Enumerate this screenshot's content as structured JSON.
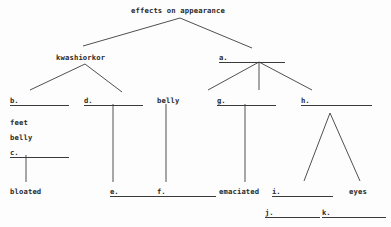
{
  "diagram": {
    "title": "effects on appearance",
    "type": "hierarchy-tree-worksheet",
    "line_color": "#3c3c3c",
    "text_color": "#2b2b2b",
    "background_color": "#fdfdfd"
  },
  "nodes": {
    "root": {
      "text": "effects on appearance",
      "x": 131,
      "y": 6
    },
    "kwashiorkor": {
      "text": "kwashiorkor",
      "x": 56,
      "y": 53
    },
    "a_blank": {
      "tag": "a.",
      "x": 219,
      "y": 53,
      "rule_width": 57
    },
    "b_blank": {
      "tag": "b.",
      "x": 10,
      "y": 96,
      "rule_width": 50
    },
    "feet": {
      "text": "feet",
      "x": 10,
      "y": 118
    },
    "belly_left": {
      "text": "belly",
      "x": 10,
      "y": 133
    },
    "c_blank": {
      "tag": "c.",
      "x": 10,
      "y": 148,
      "rule_width": 50
    },
    "d_blank": {
      "tag": "d.",
      "x": 84,
      "y": 96,
      "rule_width": 50
    },
    "belly_mid": {
      "text": "belly",
      "x": 157,
      "y": 96
    },
    "g_blank": {
      "tag": "g.",
      "x": 217,
      "y": 96,
      "rule_width": 50
    },
    "h_blank": {
      "tag": "h.",
      "x": 301,
      "y": 96,
      "rule_width": 62
    },
    "bloated": {
      "text": "bloated",
      "x": 10,
      "y": 187
    },
    "e_blank": {
      "tag": "e.",
      "x": 110,
      "y": 187,
      "rule_width": 50
    },
    "f_blank": {
      "tag": "f.",
      "x": 157,
      "y": 187,
      "rule_width": 50
    },
    "emaciated": {
      "text": "emaciated",
      "x": 219,
      "y": 187
    },
    "i_blank": {
      "tag": "i.",
      "x": 272,
      "y": 187,
      "rule_width": 52
    },
    "eyes": {
      "text": "eyes",
      "x": 349,
      "y": 187
    },
    "j_blank": {
      "tag": "j.",
      "x": 265,
      "y": 208,
      "rule_width": 46
    },
    "k_blank": {
      "tag": "k.",
      "x": 322,
      "y": 208,
      "rule_width": 55
    }
  },
  "edges": [
    {
      "name": "root-to-kwashiorkor",
      "x1": 180,
      "y1": 18,
      "x2": 83,
      "y2": 46
    },
    {
      "name": "root-to-a",
      "x1": 180,
      "y1": 18,
      "x2": 252,
      "y2": 48
    },
    {
      "name": "kwashiorkor-to-b",
      "x1": 85,
      "y1": 64,
      "x2": 30,
      "y2": 90
    },
    {
      "name": "kwashiorkor-to-d",
      "x1": 85,
      "y1": 64,
      "x2": 122,
      "y2": 92
    },
    {
      "name": "a-to-g",
      "x1": 259,
      "y1": 62,
      "x2": 208,
      "y2": 90
    },
    {
      "name": "a-to-belly",
      "x1": 259,
      "y1": 62,
      "x2": 259,
      "y2": 90
    },
    {
      "name": "a-to-h",
      "x1": 259,
      "y1": 62,
      "x2": 312,
      "y2": 90
    },
    {
      "name": "b-to-c-stem",
      "x1": 26,
      "y1": 155,
      "x2": 26,
      "y2": 182
    },
    {
      "name": "d-to-e-stem",
      "x1": 113,
      "y1": 104,
      "x2": 113,
      "y2": 182
    },
    {
      "name": "belly-to-f-stem",
      "x1": 166,
      "y1": 104,
      "x2": 166,
      "y2": 182
    },
    {
      "name": "g-to-emaciated-stem",
      "x1": 245,
      "y1": 104,
      "x2": 245,
      "y2": 182
    },
    {
      "name": "h-to-i",
      "x1": 330,
      "y1": 113,
      "x2": 304,
      "y2": 181
    },
    {
      "name": "h-to-eyes",
      "x1": 330,
      "y1": 113,
      "x2": 360,
      "y2": 181
    }
  ]
}
